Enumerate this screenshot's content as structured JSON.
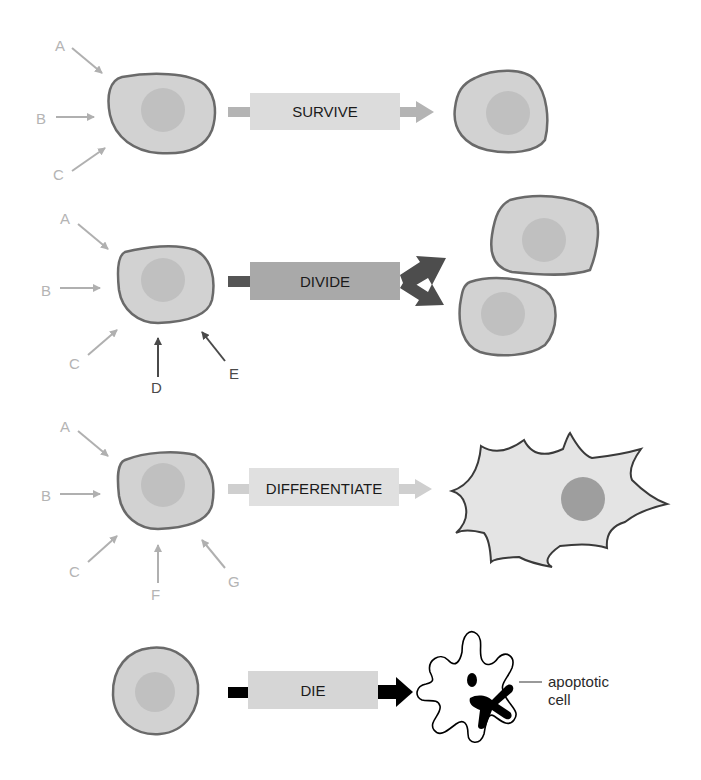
{
  "rows": [
    {
      "id": "survive",
      "signals": [
        "A",
        "B",
        "C"
      ],
      "outcome_label": "SURVIVE",
      "box_color": "#dcdcdc",
      "arrow_color": "#b4b4b4"
    },
    {
      "id": "divide",
      "signals": [
        "A",
        "B",
        "C",
        "D",
        "E"
      ],
      "outcome_label": "DIVIDE",
      "box_color": "#a9a9a9",
      "arrow_color": "#4d4d4d"
    },
    {
      "id": "differentiate",
      "signals": [
        "A",
        "B",
        "C",
        "F",
        "G"
      ],
      "outcome_label": "DIFFERENTIATE",
      "box_color": "#e0e0e0",
      "arrow_color": "#cfcfcf"
    },
    {
      "id": "die",
      "signals": [],
      "outcome_label": "DIE",
      "box_color": "#d6d6d6",
      "arrow_color": "#000000"
    }
  ],
  "annotation": {
    "line1": "apoptotic",
    "line2": "cell"
  },
  "colors": {
    "cell_fill": "#d2d2d2",
    "cell_outline": "#6a6a6a",
    "nucleus": "#bdbdbd",
    "light_signal": "#b4b4b4",
    "dark_signal": "#4a4a4a"
  }
}
